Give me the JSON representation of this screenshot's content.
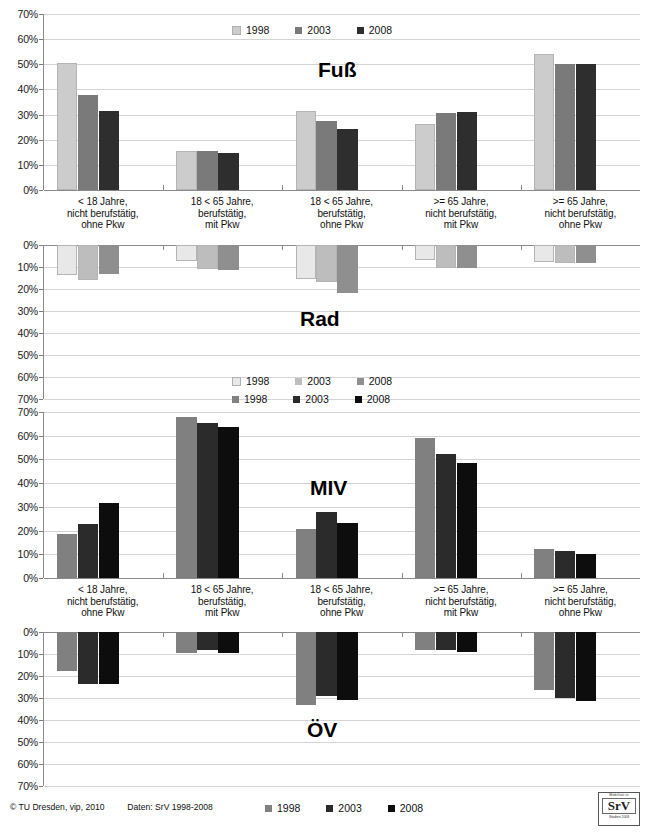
{
  "chart_data": [
    {
      "type": "bar",
      "title": "Fuß",
      "panel_id": "fuss",
      "orientation": "up",
      "categories": [
        "< 18 Jahre,\nnicht berufstätig,\nohne Pkw",
        "18 < 65 Jahre,\nberufstätig,\nmit Pkw",
        "18 < 65 Jahre,\nberufstätig,\nohne Pkw",
        ">= 65 Jahre,\nnicht berufstätig,\nmit Pkw",
        ">= 65 Jahre,\nnicht berufstätig,\nohne Pkw"
      ],
      "series": [
        {
          "name": "1998",
          "color": "#cccccc",
          "values": [
            50.7,
            15.5,
            31.3,
            26.3,
            54.2
          ]
        },
        {
          "name": "2003",
          "color": "#7a7a7a",
          "values": [
            37.9,
            15.4,
            27.5,
            30.5,
            50.1
          ]
        },
        {
          "name": "2008",
          "color": "#2e2e2e",
          "values": [
            31.4,
            14.9,
            24.4,
            30.9,
            50.1
          ]
        }
      ],
      "ylabel": "",
      "xlabel": "",
      "ylim": [
        0,
        70
      ],
      "yticks": [
        "0%",
        "10%",
        "20%",
        "30%",
        "40%",
        "50%",
        "60%",
        "70%"
      ],
      "grid": true,
      "legend_position": "top-center"
    },
    {
      "type": "bar",
      "title": "Rad",
      "panel_id": "rad",
      "orientation": "down",
      "categories": [
        "< 18 Jahre,\nnicht berufstätig,\nohne Pkw",
        "18 < 65 Jahre,\nberufstätig,\nmit Pkw",
        "18 < 65 Jahre,\nberufstätig,\nohne Pkw",
        ">= 65 Jahre,\nnicht berufstätig,\nmit Pkw",
        ">= 65 Jahre,\nnicht berufstätig,\nohne Pkw"
      ],
      "series": [
        {
          "name": "1998",
          "color": "#e8e8e8",
          "values": [
            13.8,
            7.2,
            15.3,
            7.0,
            7.6
          ]
        },
        {
          "name": "2003",
          "color": "#bdbdbd",
          "values": [
            16.1,
            11.0,
            16.8,
            10.5,
            8.2
          ]
        },
        {
          "name": "2008",
          "color": "#8f8f8f",
          "values": [
            13.2,
            11.3,
            21.8,
            10.6,
            8.3
          ]
        }
      ],
      "ylabel": "",
      "xlabel": "",
      "ylim": [
        0,
        70
      ],
      "yticks": [
        "0%",
        "10%",
        "20%",
        "30%",
        "40%",
        "50%",
        "60%",
        "70%"
      ],
      "grid": true,
      "legend_position": "bottom-center"
    },
    {
      "type": "bar",
      "title": "MIV",
      "panel_id": "miv",
      "orientation": "up",
      "categories": [
        "< 18 Jahre,\nnicht berufstätig,\nohne Pkw",
        "18 < 65 Jahre,\nberufstätig,\nmit Pkw",
        "18 < 65 Jahre,\nberufstätig,\nohne Pkw",
        ">= 65 Jahre,\nnicht berufstätig,\nmit Pkw",
        ">= 65 Jahre,\nnicht berufstätig,\nohne Pkw"
      ],
      "series": [
        {
          "name": "1998",
          "color": "#808080",
          "values": [
            18.4,
            68.1,
            20.6,
            58.9,
            12.1
          ]
        },
        {
          "name": "2003",
          "color": "#2b2b2b",
          "values": [
            22.6,
            65.4,
            28.0,
            52.5,
            11.2
          ]
        },
        {
          "name": "2008",
          "color": "#0d0d0d",
          "values": [
            31.6,
            63.7,
            23.1,
            48.5,
            10.3
          ]
        }
      ],
      "ylabel": "",
      "xlabel": "",
      "ylim": [
        0,
        70
      ],
      "yticks": [
        "0%",
        "10%",
        "20%",
        "30%",
        "40%",
        "50%",
        "60%",
        "70%"
      ],
      "grid": true,
      "legend_position": "top-center"
    },
    {
      "type": "bar",
      "title": "ÖV",
      "panel_id": "oev",
      "orientation": "down",
      "categories": [
        "< 18 Jahre,\nnicht berufstätig,\nohne Pkw",
        "18 < 65 Jahre,\nberufstätig,\nmit Pkw",
        "18 < 65 Jahre,\nberufstätig,\nohne Pkw",
        ">= 65 Jahre,\nnicht berufstätig,\nmit Pkw",
        ">= 65 Jahre,\nnicht berufstätig,\nohne Pkw"
      ],
      "series": [
        {
          "name": "1998",
          "color": "#808080",
          "values": [
            17.6,
            9.7,
            33.1,
            8.4,
            26.5
          ]
        },
        {
          "name": "2003",
          "color": "#2b2b2b",
          "values": [
            23.7,
            8.4,
            28.9,
            8.1,
            30.2
          ]
        },
        {
          "name": "2008",
          "color": "#0d0d0d",
          "values": [
            23.6,
            9.5,
            31.0,
            9.2,
            31.2
          ]
        }
      ],
      "ylabel": "",
      "xlabel": "",
      "ylim": [
        0,
        70
      ],
      "yticks": [
        "0%",
        "10%",
        "20%",
        "30%",
        "40%",
        "50%",
        "60%",
        "70%"
      ],
      "grid": true,
      "legend_position": "bottom-center"
    }
  ],
  "legends": {
    "fuss": [
      {
        "label": "1998",
        "color": "#cccccc"
      },
      {
        "label": "2003",
        "color": "#7a7a7a"
      },
      {
        "label": "2008",
        "color": "#2e2e2e"
      }
    ],
    "rad": [
      {
        "label": "1998",
        "color": "#e8e8e8"
      },
      {
        "label": "2003",
        "color": "#bdbdbd"
      },
      {
        "label": "2008",
        "color": "#8f8f8f"
      }
    ],
    "miv": [
      {
        "label": "1998",
        "color": "#808080"
      },
      {
        "label": "2003",
        "color": "#2b2b2b"
      },
      {
        "label": "2008",
        "color": "#0d0d0d"
      }
    ],
    "oev": [
      {
        "label": "1998",
        "color": "#808080"
      },
      {
        "label": "2003",
        "color": "#2b2b2b"
      },
      {
        "label": "2008",
        "color": "#0d0d0d"
      }
    ]
  },
  "footer": {
    "copyright": "© TU Dresden, vip, 2010",
    "source": "Daten: SrV 1998-2008"
  },
  "logo": {
    "top_text": "Mobilität in",
    "main_text": "SrV",
    "bottom_text": "Städten 2008"
  },
  "colors": {
    "grid": "#d4d4d4",
    "axis": "#8a8a8a",
    "text": "#111111",
    "background": "#ffffff"
  }
}
